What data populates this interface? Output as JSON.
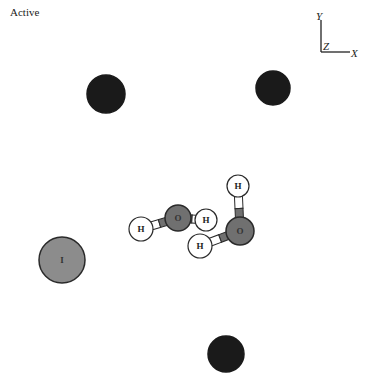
{
  "status": {
    "label": "Active"
  },
  "axes": {
    "x_label": "X",
    "y_label": "Y",
    "z_label": "Z"
  },
  "colors": {
    "background": "#ffffff",
    "dark_atom": "#1a1a1a",
    "oxygen": "#707070",
    "iodine": "#8c8c8c",
    "hydrogen": "#ffffff",
    "outline": "#2a2a2a"
  },
  "atoms": [
    {
      "id": "dark-1",
      "element": "",
      "label": "",
      "cx": 106,
      "cy": 94,
      "r": 19,
      "type": "dark"
    },
    {
      "id": "dark-2",
      "element": "",
      "label": "",
      "cx": 273,
      "cy": 88,
      "r": 17,
      "type": "dark"
    },
    {
      "id": "dark-3",
      "element": "",
      "label": "",
      "cx": 226,
      "cy": 354,
      "r": 18,
      "type": "dark"
    },
    {
      "id": "iodine",
      "element": "I",
      "label": "I",
      "cx": 62,
      "cy": 260,
      "r": 23,
      "type": "iodine"
    },
    {
      "id": "w1-h1",
      "element": "H",
      "label": "H",
      "cx": 141,
      "cy": 229,
      "r": 12,
      "type": "hydrogen"
    },
    {
      "id": "w1-o",
      "element": "O",
      "label": "O",
      "cx": 178,
      "cy": 218,
      "r": 13,
      "type": "oxygen"
    },
    {
      "id": "w1-h2",
      "element": "H",
      "label": "H",
      "cx": 206,
      "cy": 220,
      "r": 11,
      "type": "hydrogen"
    },
    {
      "id": "w2-h1",
      "element": "H",
      "label": "H",
      "cx": 238,
      "cy": 186,
      "r": 11,
      "type": "hydrogen"
    },
    {
      "id": "w2-o",
      "element": "O",
      "label": "O",
      "cx": 240,
      "cy": 231,
      "r": 14,
      "type": "oxygen"
    },
    {
      "id": "w2-h2",
      "element": "H",
      "label": "H",
      "cx": 200,
      "cy": 246,
      "r": 12,
      "type": "hydrogen"
    }
  ],
  "bonds": [
    {
      "from": "w1-h1",
      "to": "w1-o"
    },
    {
      "from": "w1-o",
      "to": "w1-h2"
    },
    {
      "from": "w2-h1",
      "to": "w2-o"
    },
    {
      "from": "w2-o",
      "to": "w2-h2"
    }
  ]
}
